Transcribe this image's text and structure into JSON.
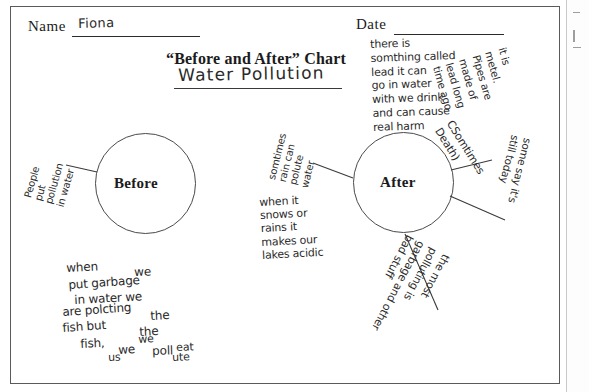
{
  "worksheet": {
    "name_label": "Name",
    "name_value": "Fiona",
    "date_label": "Date",
    "date_value": "",
    "chart_title": "“Before and After” Chart",
    "topic_value": "Water Pollution"
  },
  "circles": {
    "before_label": "Before",
    "after_label": "After"
  },
  "notes": {
    "before_left": "People\nput\npollution\nin water",
    "before_bottom_l1": "when",
    "before_bottom_l2": "we",
    "before_bottom_l3": "put garbage",
    "before_bottom_l4": "in water we",
    "before_bottom_l5": "are polcting",
    "before_bottom_l6": "the",
    "before_bottom_l7": "fish but",
    "before_bottom_l8": "the",
    "before_bottom_l9": "fish,",
    "before_bottom_l10": "we",
    "before_bottom_l11": "we",
    "before_bottom_l12": "poll",
    "before_bottom_l13": "eat",
    "before_bottom_l14": "us",
    "before_bottom_l15": "ute",
    "after_top": "there is\nsomthing called\nlead it can\ngo in water\nwith we drink\nand can cause\nreal harm",
    "after_rain": "somtimes\nrain can\npolute\nwater",
    "after_snow": "when it\nsnows or\nrains it\nmakes our\nlakes acidic",
    "after_metal": "it is\nmetel.\nPipes are\nmade of\nlead long\ntime ago",
    "after_death": "CSomtimes\nDeath)",
    "after_today": "some say it's\nstill today",
    "after_garbage": "the most\npolluting is\ngarbage and other\nbad stuff"
  },
  "colors": {
    "ink": "#2a2a2a",
    "print": "#1b1b1b",
    "border": "#5a5a5a",
    "circle_stroke": "#4a4a4a"
  }
}
